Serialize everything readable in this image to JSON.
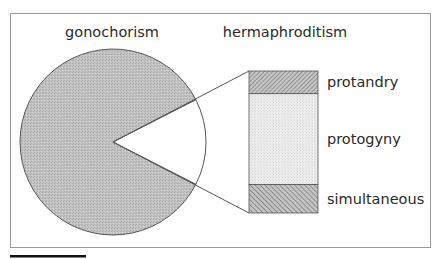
{
  "chart_data": {
    "type": "pie",
    "title": "",
    "headings": {
      "left": "gonochorism",
      "right": "hermaphroditism"
    },
    "pie": {
      "slices": [
        {
          "name": "gonochorism",
          "value": 85
        },
        {
          "name": "hermaphroditism",
          "value": 15
        }
      ]
    },
    "breakdown": {
      "of": "hermaphroditism",
      "segments": [
        {
          "name": "protandry",
          "value": 16,
          "pattern": "dense-hatch"
        },
        {
          "name": "protogyny",
          "value": 64,
          "pattern": "light-stipple"
        },
        {
          "name": "simultaneous",
          "value": 20,
          "pattern": "hatch"
        }
      ]
    },
    "colors": {
      "pie_fill": "#bdbdbd",
      "outline": "#555555",
      "frame": "#9a9a9a",
      "scale_bar": "#111111"
    }
  }
}
